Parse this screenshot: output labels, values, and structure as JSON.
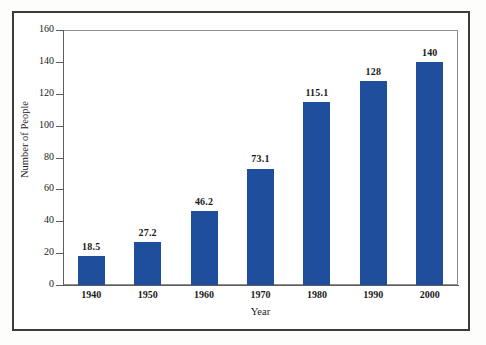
{
  "chart_data": {
    "type": "bar",
    "title": "",
    "subtitle": "",
    "xlabel": "Year",
    "ylabel": "Number of People",
    "categories": [
      "1940",
      "1950",
      "1960",
      "1970",
      "1980",
      "1990",
      "2000"
    ],
    "values": [
      18.5,
      27.2,
      46.2,
      73.1,
      115.1,
      128,
      140
    ],
    "value_labels": [
      "18.5",
      "27.2",
      "46.2",
      "73.1",
      "115.1",
      "128",
      "140"
    ],
    "series": [
      {
        "name": "Number of People",
        "values": [
          18.5,
          27.2,
          46.2,
          73.1,
          115.1,
          128,
          140
        ]
      }
    ],
    "ylim": [
      0,
      160
    ],
    "y_ticks": [
      0,
      20,
      40,
      60,
      80,
      100,
      120,
      140,
      160
    ],
    "y_tick_labels": [
      "0",
      "20",
      "40",
      "60",
      "80",
      "100",
      "120",
      "140",
      "160"
    ],
    "grid": false,
    "legend": false,
    "legend_position": "none",
    "bar_color": "#1F4E9C",
    "axis_color": "#5D5D5D",
    "frame_color": "#3B3B3B",
    "background": "#FFFFFF",
    "data_labels_shown": true
  }
}
